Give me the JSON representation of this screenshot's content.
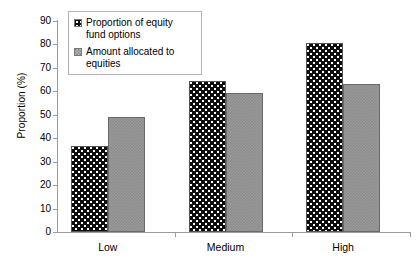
{
  "chart_data": {
    "type": "bar",
    "title": "",
    "xlabel": "",
    "ylabel": "Proportion (%)",
    "categories": [
      "Low",
      "Medium",
      "High"
    ],
    "series": [
      {
        "name": "Proportion of equity fund options",
        "values": [
          36.5,
          64.5,
          80.5
        ]
      },
      {
        "name": "Amount allocated to equities",
        "values": [
          49,
          59.5,
          63
        ]
      }
    ],
    "ylim": [
      0,
      90
    ],
    "ytick_step": 10,
    "yticks": [
      "0",
      "10",
      "20",
      "30",
      "40",
      "50",
      "60",
      "70",
      "80",
      "90"
    ],
    "grid": false,
    "legend_position": "top-left",
    "colors": {
      "series_0": "#0d0d0d",
      "series_1": "#8d8d8d",
      "axis": "#9a9a9a",
      "legend_border": "#b4b4b4",
      "background": "#ffffff"
    }
  }
}
